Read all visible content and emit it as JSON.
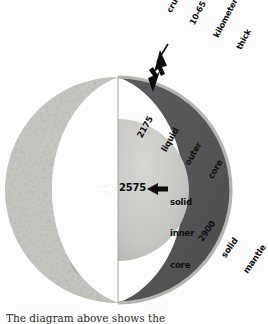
{
  "figure": {
    "background_color": "#fdfdfd",
    "caption": "The diagram above shows the"
  },
  "colors": {
    "mantle": "#555558",
    "outer_core": "#c9c9c7",
    "crust": "#b9b9b5",
    "surface_light": "#e3e2dd",
    "surface_shadow": "#b0afa9",
    "arrow_black": "#0d0d0d",
    "arrow_white": "#ffffff",
    "text": "#101010"
  },
  "layers": [
    {
      "id": "crust",
      "name": "crust",
      "value": "10-65",
      "unit": "kilometers",
      "qualifier": "thick",
      "label_lines": [
        "crust",
        "10-65",
        "kilometers",
        "thick"
      ],
      "rotation_deg": -62,
      "color": "#b9b9b5"
    },
    {
      "id": "mantle",
      "name": "mantle",
      "value": "2900",
      "state": "solid",
      "label_lines": [
        "2900",
        "solid",
        "mantle"
      ],
      "rotation_deg": -55,
      "color": "#555558"
    },
    {
      "id": "outer-core",
      "name": "liquid outer core",
      "value": "2175",
      "state": "liquid",
      "label_lines": [
        "2175",
        "liquid",
        "outer",
        "core"
      ],
      "rotation_deg": -60,
      "color": "#c9c9c7"
    },
    {
      "id": "inner-core",
      "name": "solid inner core",
      "value": "2575",
      "state": "solid",
      "label_lines": [
        "solid",
        "inner",
        "core"
      ],
      "rotation_deg": 0,
      "color": "#c9c9c7"
    }
  ],
  "annotations": {
    "crust_label_lines": [
      "crust",
      "10-65",
      "kilometers",
      "thick"
    ],
    "outer_core_label_lines": [
      "2175",
      "liquid",
      "outer",
      "core"
    ],
    "inner_core_value": "2575",
    "inner_core_label_lines": [
      "solid",
      "inner",
      "core"
    ],
    "mantle_label_lines": [
      "2900",
      "solid",
      "mantle"
    ]
  },
  "arrows": [
    {
      "id": "crust-arrow-upper",
      "color": "#0d0d0d",
      "direction": "down-left",
      "target": "crust"
    },
    {
      "id": "crust-arrow-lower",
      "color": "#0d0d0d",
      "direction": "up-left",
      "target": "crust"
    },
    {
      "id": "inner-core-arrow",
      "color": "#0d0d0d",
      "direction": "left",
      "target": "inner-core"
    },
    {
      "id": "radius-arrow",
      "color": "#ffffff",
      "direction": "right",
      "target": "inner-core"
    }
  ]
}
